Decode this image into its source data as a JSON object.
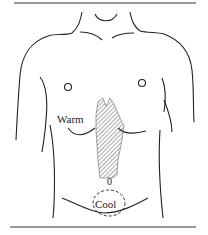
{
  "figure": {
    "labels": {
      "warm": "Warm",
      "navel_marker": "0",
      "cool": "Cool"
    },
    "regions": {
      "warm_region": "hatched area from sternum down to navel",
      "cool_region": "dashed circle below navel"
    },
    "colors": {
      "line": "#222222",
      "hatch": "#555555",
      "background": "#ffffff"
    }
  }
}
